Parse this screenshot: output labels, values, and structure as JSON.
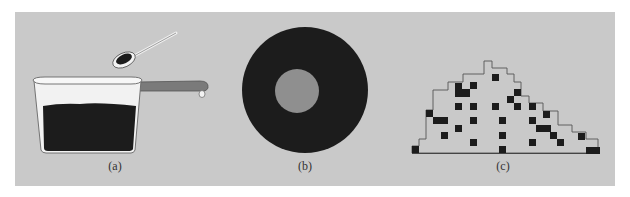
{
  "figure": {
    "background_color": "#c9c9c9",
    "panels": [
      {
        "id": "a",
        "label": "(a)",
        "description": "pot-filled-with-beans-and-spoon"
      },
      {
        "id": "b",
        "label": "(b)",
        "description": "dark-disk-with-gray-center"
      },
      {
        "id": "c",
        "label": "(c)",
        "description": "stepped-pile-with-black-squares"
      }
    ]
  },
  "colors": {
    "dark": "#1c1c1c",
    "inner_circle": "#8f8f8f",
    "outline": "#555555",
    "handle": "#7a7a7a",
    "pot_fill": "#f2f2f2"
  }
}
